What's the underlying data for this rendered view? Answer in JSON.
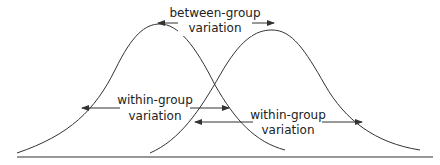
{
  "diagram": {
    "type": "overlapping-normal-distributions",
    "colors": {
      "stroke": "#333333",
      "text": "#222222",
      "background": "#ffffff"
    },
    "labels": {
      "between": {
        "line1": "between-group",
        "line2": "variation"
      },
      "within_left": {
        "line1": "within-group",
        "line2": "variation"
      },
      "within_right": {
        "line1": "within-group",
        "line2": "variation"
      }
    },
    "curves": [
      {
        "name": "group-1-distribution",
        "peak_x": 160
      },
      {
        "name": "group-2-distribution",
        "peak_x": 272
      }
    ]
  }
}
